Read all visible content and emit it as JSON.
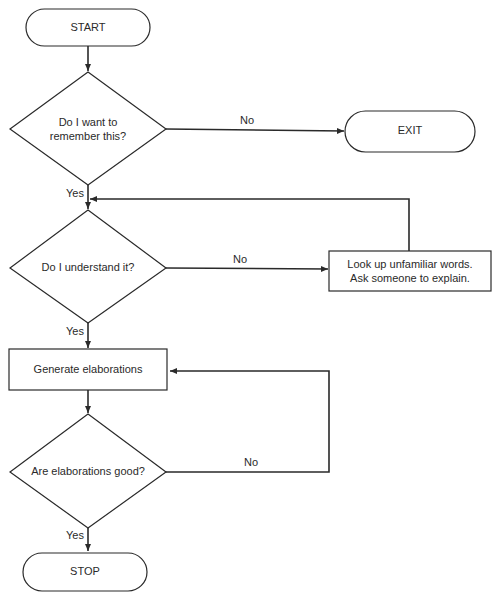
{
  "flowchart": {
    "nodes": {
      "start": {
        "type": "terminal",
        "label": "START"
      },
      "q_remember": {
        "type": "decision",
        "label_line1": "Do I want to",
        "label_line2": "remember this?"
      },
      "exit": {
        "type": "terminal",
        "label": "EXIT"
      },
      "q_understand": {
        "type": "decision",
        "label": "Do I understand it?"
      },
      "lookup": {
        "type": "process",
        "label_line1": "Look up unfamiliar words.",
        "label_line2": "Ask someone to explain."
      },
      "generate": {
        "type": "process",
        "label": "Generate elaborations"
      },
      "q_good": {
        "type": "decision",
        "label": "Are elaborations good?"
      },
      "stop": {
        "type": "terminal",
        "label": "STOP"
      }
    },
    "edges": {
      "remember_no": "No",
      "remember_yes": "Yes",
      "understand_no": "No",
      "understand_yes": "Yes",
      "good_no": "No",
      "good_yes": "Yes"
    },
    "colors": {
      "line": "#2a2a2a",
      "background": "#ffffff"
    }
  }
}
